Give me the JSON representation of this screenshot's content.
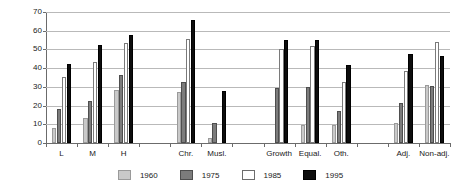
{
  "chart_data": {
    "type": "bar",
    "title": "",
    "subtitle": "",
    "xlabel": "",
    "ylabel": "",
    "ylim": [
      0,
      70
    ],
    "yticks": [
      0,
      10,
      20,
      30,
      40,
      50,
      60,
      70
    ],
    "grid": true,
    "legend_position": "bottom",
    "categories": [
      "L",
      "M",
      "H",
      "Chr.",
      "Musl.",
      "Growth",
      "Equal.",
      "Oth.",
      "Adj.",
      "Non-adj."
    ],
    "category_groups": [
      {
        "name": "education",
        "members": [
          "L",
          "M",
          "H"
        ]
      },
      {
        "name": "religion",
        "members": [
          "Chr.",
          "Musl."
        ]
      },
      {
        "name": "priority",
        "members": [
          "Growth",
          "Equal.",
          "Oth."
        ]
      },
      {
        "name": "adjustment",
        "members": [
          "Adj.",
          "Non-adj."
        ]
      }
    ],
    "series": [
      {
        "name": "1960",
        "color": "#c9c9c9",
        "values": [
          8,
          13.5,
          28.5,
          27,
          2.5,
          0,
          9.5,
          9.5,
          10.5,
          31
        ]
      },
      {
        "name": "1975",
        "color": "#7c7c7c",
        "values": [
          18,
          22.5,
          36.5,
          32.5,
          10.5,
          29.5,
          30,
          17,
          21.5,
          30.5
        ]
      },
      {
        "name": "1985",
        "color": "#ffffff",
        "values": [
          35.5,
          43.5,
          53.5,
          55.5,
          0,
          50.5,
          52,
          32.5,
          38.5,
          54
        ]
      },
      {
        "name": "1995",
        "color": "#0d0d0d",
        "values": [
          42,
          52.5,
          57.5,
          65.5,
          28,
          55,
          55,
          41.5,
          47.5,
          46.5
        ]
      }
    ]
  },
  "legend": {
    "entries": [
      {
        "label": "1960",
        "swatch": "s1960"
      },
      {
        "label": "1975",
        "swatch": "s1975"
      },
      {
        "label": "1985",
        "swatch": "s1985"
      },
      {
        "label": "1995",
        "swatch": "s1995"
      }
    ]
  },
  "colors": {
    "series_1960": "#c9c9c9",
    "series_1975": "#7c7c7c",
    "series_1985": "#ffffff",
    "series_1995": "#0d0d0d",
    "axis": "#6b6b6b",
    "gridline": "#b9b9b9",
    "text": "#1a1a1a",
    "background": "#ffffff"
  }
}
